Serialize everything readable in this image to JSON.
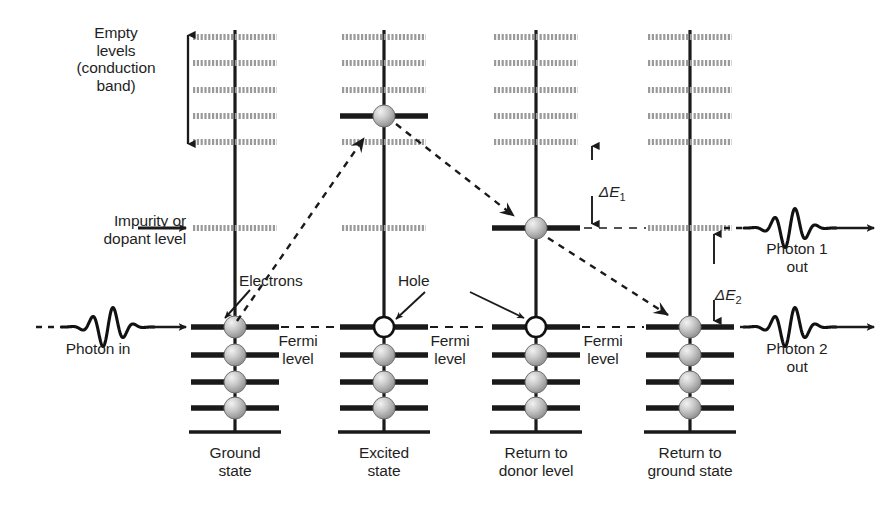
{
  "figure": {
    "background": "#ffffff",
    "ink": "#1a1a1a",
    "gray_level_color": "#9a9a9a",
    "filled_level_color": "#1a1a1a",
    "electron_color": "#b8b8b8"
  },
  "labels": {
    "empty_levels": "Empty\nlevels\n(conduction\nband)",
    "impurity": "Impurity or\ndopant level",
    "photon_in": "Photon in",
    "electrons": "Electrons",
    "hole": "Hole",
    "fermi_1": "Fermi\nlevel",
    "fermi_2": "Fermi\nlevel",
    "fermi_3": "Fermi\nlevel",
    "delta_e1_sym": "Δ",
    "delta_e1_var": "E",
    "delta_e1_sub": "1",
    "delta_e2_sym": "Δ",
    "delta_e2_var": "E",
    "delta_e2_sub": "2",
    "photon1_out": "Photon 1\nout",
    "photon2_out": "Photon 2\nout"
  },
  "columns": [
    {
      "id": "ground-state",
      "caption": "Ground\nstate",
      "axis_x": 235
    },
    {
      "id": "excited-state",
      "caption": "Excited\nstate",
      "axis_x": 384
    },
    {
      "id": "return-donor",
      "caption": "Return to\ndonor level",
      "axis_x": 536
    },
    {
      "id": "return-ground",
      "caption": "Return to\nground state",
      "axis_x": 690
    }
  ],
  "geometry": {
    "conduction_y": [
      37,
      63,
      90,
      116,
      142
    ],
    "impurity_y": 228,
    "fermi_y": 327,
    "valence_y": [
      327,
      355,
      382,
      408
    ],
    "base_y": 432,
    "half_width_gray": 42,
    "half_width_dark": 44,
    "axis_top": 30,
    "axis_bottom": 432
  },
  "states": {
    "ground-state": {
      "conduction_dark_index": null,
      "conduction_electron": false,
      "impurity_dark": false,
      "impurity_electron": false,
      "fermi_occupancy": "electron",
      "valence_filled": [
        true,
        true,
        true,
        true
      ]
    },
    "excited-state": {
      "conduction_dark_index": 3,
      "conduction_electron": true,
      "impurity_dark": false,
      "impurity_electron": false,
      "fermi_occupancy": "hole",
      "valence_filled": [
        false,
        true,
        true,
        true
      ]
    },
    "return-donor": {
      "conduction_dark_index": null,
      "conduction_electron": false,
      "impurity_dark": true,
      "impurity_electron": true,
      "fermi_occupancy": "hole",
      "valence_filled": [
        false,
        true,
        true,
        true
      ]
    },
    "return-ground": {
      "conduction_dark_index": null,
      "conduction_electron": false,
      "impurity_dark": false,
      "impurity_electron": false,
      "fermi_occupancy": "electron",
      "valence_filled": [
        true,
        true,
        true,
        true
      ]
    }
  },
  "transitions": [
    {
      "id": "absorption",
      "from": "ground-state fermi",
      "to": "excited-state conduction",
      "style": "dashed-arrow"
    },
    {
      "id": "relaxation",
      "from": "excited-state conduction",
      "to": "return-donor impurity",
      "style": "dashed-arrow"
    },
    {
      "id": "recombination",
      "from": "return-donor impurity",
      "to": "return-ground fermi",
      "style": "dashed-arrow"
    }
  ],
  "energy_gaps": [
    {
      "id": "delta-e1",
      "label": "ΔE1",
      "top_y": 142,
      "bottom_y": 228
    },
    {
      "id": "delta-e2",
      "label": "ΔE2",
      "top_y": 228,
      "bottom_y": 327
    }
  ],
  "photons": [
    {
      "id": "photon-in",
      "label": "Photon in",
      "y": 327,
      "direction": "right"
    },
    {
      "id": "photon-1-out",
      "label": "Photon 1 out",
      "y": 228,
      "direction": "right"
    },
    {
      "id": "photon-2-out",
      "label": "Photon 2 out",
      "y": 327,
      "direction": "right"
    }
  ]
}
